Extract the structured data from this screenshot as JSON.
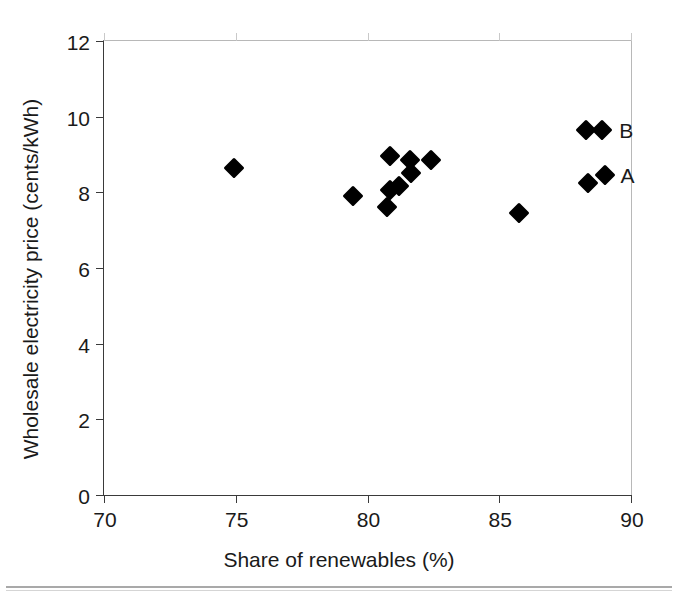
{
  "figure": {
    "name": "scatter-plot-renewables-vs-price"
  },
  "chart_data": {
    "type": "scatter",
    "title": "",
    "xlabel": "Share of  renewables (%)",
    "ylabel": "Wholesale electricity price (cents/kWh)",
    "xlim": [
      70,
      90
    ],
    "ylim": [
      0,
      12
    ],
    "xticks": [
      70,
      75,
      80,
      85,
      90
    ],
    "yticks": [
      0,
      2,
      4,
      6,
      8,
      10,
      12
    ],
    "xtick_labels": [
      "70",
      "75",
      "80",
      "85",
      "90"
    ],
    "ytick_labels": [
      "0",
      "2",
      "4",
      "6",
      "8",
      "10",
      "12"
    ],
    "grid": false,
    "legend": null,
    "marker": "filled-diamond",
    "marker_color": "#000000",
    "points": [
      {
        "x": 74.95,
        "y": 8.65,
        "label": ""
      },
      {
        "x": 79.45,
        "y": 7.9,
        "label": ""
      },
      {
        "x": 80.85,
        "y": 8.95,
        "label": ""
      },
      {
        "x": 80.85,
        "y": 8.05,
        "label": ""
      },
      {
        "x": 80.75,
        "y": 7.62,
        "label": ""
      },
      {
        "x": 81.2,
        "y": 8.18,
        "label": ""
      },
      {
        "x": 81.6,
        "y": 8.85,
        "label": ""
      },
      {
        "x": 81.65,
        "y": 8.52,
        "label": ""
      },
      {
        "x": 82.4,
        "y": 8.85,
        "label": ""
      },
      {
        "x": 85.75,
        "y": 7.45,
        "label": ""
      },
      {
        "x": 88.3,
        "y": 9.65,
        "label": ""
      },
      {
        "x": 88.9,
        "y": 9.65,
        "label": "B"
      },
      {
        "x": 88.35,
        "y": 8.25,
        "label": ""
      },
      {
        "x": 89.0,
        "y": 8.45,
        "label": "A"
      }
    ],
    "annotations": [
      {
        "text": "B",
        "x": 89.55,
        "y": 9.65
      },
      {
        "text": "A",
        "x": 89.6,
        "y": 8.45
      }
    ]
  },
  "colors": {
    "marker": "#000000",
    "axis": "#3a3a3a",
    "frame_light": "#b8b8b8",
    "text": "#1a1a1a",
    "background": "#ffffff"
  }
}
